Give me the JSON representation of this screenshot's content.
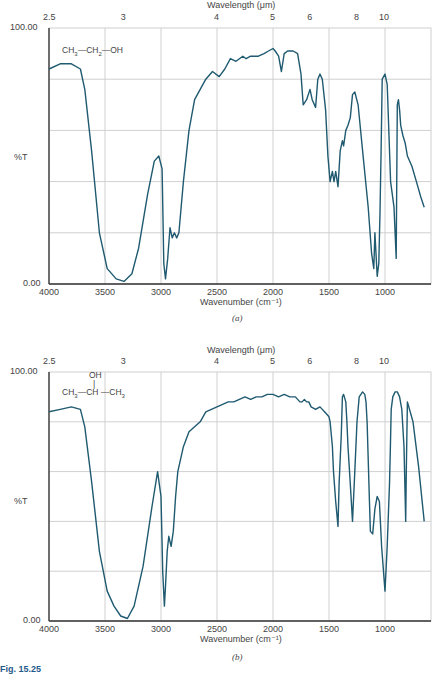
{
  "figure_label": "Fig. 15.25",
  "chart_data": [
    {
      "type": "line",
      "panel": "a",
      "caption": "(a)",
      "molecule": "CH3—CH2—OH",
      "molecule_name": "ethanol",
      "xlabel": "Wavenumber (cm⁻¹)",
      "x2label": "Wavelength (μm)",
      "ylabel": "%T",
      "ylim": [
        0,
        100
      ],
      "xlim": [
        4000,
        650
      ],
      "x_ticks": [
        4000,
        3500,
        3000,
        2500,
        2000,
        1500,
        1000
      ],
      "x2_ticks": [
        "2.5",
        "3",
        "4",
        "5",
        "6",
        "8",
        "10"
      ],
      "y_tick_labels": [
        "100.00",
        "0.00"
      ],
      "grid": true,
      "line_color": "#1f5a70",
      "x": [
        4000,
        3900,
        3800,
        3720,
        3680,
        3620,
        3550,
        3480,
        3400,
        3330,
        3260,
        3200,
        3120,
        3060,
        3020,
        2990,
        2975,
        2960,
        2940,
        2920,
        2900,
        2880,
        2860,
        2840,
        2800,
        2750,
        2700,
        2600,
        2540,
        2480,
        2430,
        2380,
        2330,
        2270,
        2240,
        2200,
        2130,
        2080,
        2040,
        2000,
        1980,
        1950,
        1925,
        1900,
        1870,
        1820,
        1780,
        1750,
        1730,
        1700,
        1670,
        1650,
        1620,
        1600,
        1580,
        1560,
        1530,
        1510,
        1490,
        1470,
        1455,
        1440,
        1420,
        1400,
        1380,
        1370,
        1350,
        1330,
        1310,
        1290,
        1270,
        1240,
        1200,
        1150,
        1120,
        1100,
        1090,
        1070,
        1055,
        1045,
        1035,
        1025,
        1000,
        980,
        950,
        920,
        900,
        890,
        880,
        870,
        860,
        840,
        820,
        800,
        760,
        720,
        680,
        650
      ],
      "values": [
        84,
        86,
        86,
        84,
        76,
        52,
        20,
        6,
        2,
        1,
        4,
        14,
        35,
        48,
        50,
        45,
        8,
        2,
        10,
        22,
        18,
        20,
        18,
        20,
        40,
        60,
        72,
        80,
        83,
        81,
        84,
        88,
        87,
        89,
        88,
        89,
        89,
        90,
        91,
        92,
        91,
        89,
        83,
        90,
        91,
        91,
        90,
        82,
        70,
        72,
        76,
        72,
        69,
        80,
        82,
        80,
        68,
        50,
        40,
        44,
        40,
        44,
        38,
        52,
        56,
        54,
        60,
        62,
        65,
        74,
        75,
        70,
        52,
        30,
        12,
        6,
        20,
        3,
        8,
        28,
        52,
        80,
        82,
        78,
        40,
        30,
        10,
        70,
        72,
        68,
        62,
        58,
        55,
        50,
        46,
        40,
        34,
        30
      ]
    },
    {
      "type": "line",
      "panel": "b",
      "caption": "(b)",
      "molecule": "CH3—CH(OH)—CH3",
      "molecule_name": "2-propanol",
      "xlabel": "Wavenumber (cm⁻¹)",
      "x2label": "Wavelength (μm)",
      "ylabel": "%T",
      "ylim": [
        0,
        100
      ],
      "xlim": [
        4000,
        650
      ],
      "x_ticks": [
        4000,
        3500,
        3000,
        2500,
        2000,
        1500,
        1000
      ],
      "x2_ticks": [
        "2.5",
        "3",
        "4",
        "5",
        "6",
        "8",
        "10"
      ],
      "y_tick_labels": [
        "100.00",
        "0.00"
      ],
      "grid": true,
      "line_color": "#1f5a70",
      "x": [
        4000,
        3900,
        3800,
        3720,
        3680,
        3620,
        3550,
        3480,
        3420,
        3360,
        3300,
        3240,
        3160,
        3080,
        3030,
        3000,
        2985,
        2970,
        2960,
        2945,
        2930,
        2910,
        2890,
        2870,
        2850,
        2800,
        2750,
        2700,
        2650,
        2600,
        2550,
        2500,
        2450,
        2400,
        2350,
        2300,
        2250,
        2200,
        2150,
        2100,
        2050,
        2000,
        1950,
        1900,
        1850,
        1800,
        1760,
        1740,
        1720,
        1700,
        1680,
        1660,
        1620,
        1580,
        1560,
        1540,
        1520,
        1500,
        1490,
        1470,
        1460,
        1440,
        1420,
        1410,
        1390,
        1380,
        1370,
        1350,
        1340,
        1330,
        1310,
        1290,
        1270,
        1250,
        1230,
        1200,
        1180,
        1170,
        1160,
        1150,
        1140,
        1130,
        1110,
        1090,
        1070,
        1050,
        1030,
        1000,
        980,
        960,
        952,
        945,
        930,
        910,
        890,
        870,
        850,
        830,
        815,
        810,
        800,
        750,
        700,
        650
      ],
      "values": [
        84,
        85,
        86,
        85,
        78,
        56,
        28,
        12,
        6,
        2,
        1,
        6,
        22,
        46,
        60,
        50,
        20,
        6,
        14,
        28,
        34,
        30,
        36,
        50,
        60,
        70,
        76,
        78,
        80,
        84,
        85,
        86,
        87,
        88,
        88,
        89,
        90,
        89,
        90,
        90,
        91,
        91,
        90,
        91,
        90,
        90,
        88,
        88,
        89,
        88,
        88,
        86,
        85,
        86,
        85,
        84,
        83,
        82,
        80,
        70,
        60,
        48,
        38,
        55,
        75,
        90,
        91,
        88,
        80,
        70,
        55,
        40,
        60,
        80,
        90,
        92,
        91,
        88,
        80,
        65,
        50,
        36,
        35,
        45,
        50,
        48,
        30,
        12,
        30,
        55,
        70,
        85,
        90,
        92,
        92,
        90,
        85,
        70,
        40,
        60,
        88,
        80,
        62,
        40
      ]
    }
  ]
}
